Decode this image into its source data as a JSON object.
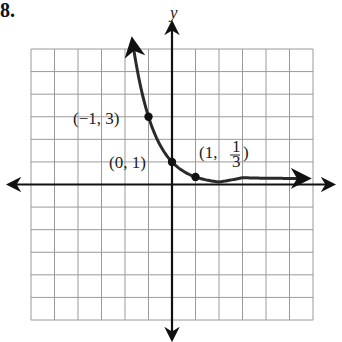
{
  "problem_number": "8.",
  "chart_data": {
    "type": "line",
    "title": "",
    "function": "y = 3^(-x)",
    "xlabel": "",
    "ylabel": "y",
    "xlim": [
      -6,
      6
    ],
    "ylim": [
      -6,
      6
    ],
    "grid": true,
    "tick_labels": false,
    "series": [
      {
        "name": "y = (1/3)^x",
        "x": [
          -1.66,
          -1.5,
          -1.25,
          -1,
          -0.75,
          -0.5,
          -0.25,
          0,
          0.25,
          0.5,
          1,
          1.5,
          2,
          3,
          4,
          5,
          5.6
        ],
        "y": [
          6.2,
          5.2,
          3.95,
          3,
          2.28,
          1.73,
          1.32,
          1,
          0.76,
          0.58,
          0.333,
          0.19,
          0.111,
          0.037,
          0.012,
          0.004,
          0.002
        ]
      }
    ],
    "annotations": [
      {
        "text": "(−1, 3)",
        "x": -1,
        "y": 3
      },
      {
        "text": "(0, 1)",
        "x": 0,
        "y": 1
      },
      {
        "text": "(1, 1/3)",
        "x": 1,
        "y": 0.3333
      }
    ]
  },
  "labels": {
    "y_axis": "y",
    "pt1": "(−1, 3)",
    "pt2": "(0, 1)",
    "pt3_prefix": "(1, ",
    "pt3_num": "1",
    "pt3_den": "3",
    "pt3_suffix": ")"
  },
  "colors": {
    "grid": "#9a9a9a",
    "axis": "#111111",
    "curve": "#2a2a2a"
  }
}
